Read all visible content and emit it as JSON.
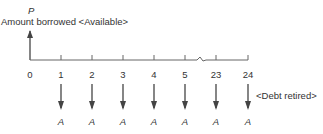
{
  "diagram": {
    "type": "cash-flow-diagram",
    "top_symbol": "P",
    "top_label": "Amount borrowed <Available>",
    "right_label": "<Debt retired>",
    "periods": [
      "0",
      "1",
      "2",
      "3",
      "4",
      "5",
      "23",
      "24"
    ],
    "payment_symbol": "A",
    "payment_periods": [
      "1",
      "2",
      "3",
      "4",
      "5",
      "23",
      "24"
    ],
    "axis_break_between": [
      "5",
      "23"
    ],
    "colors": {
      "line": "#555555",
      "text": "#333333"
    }
  }
}
